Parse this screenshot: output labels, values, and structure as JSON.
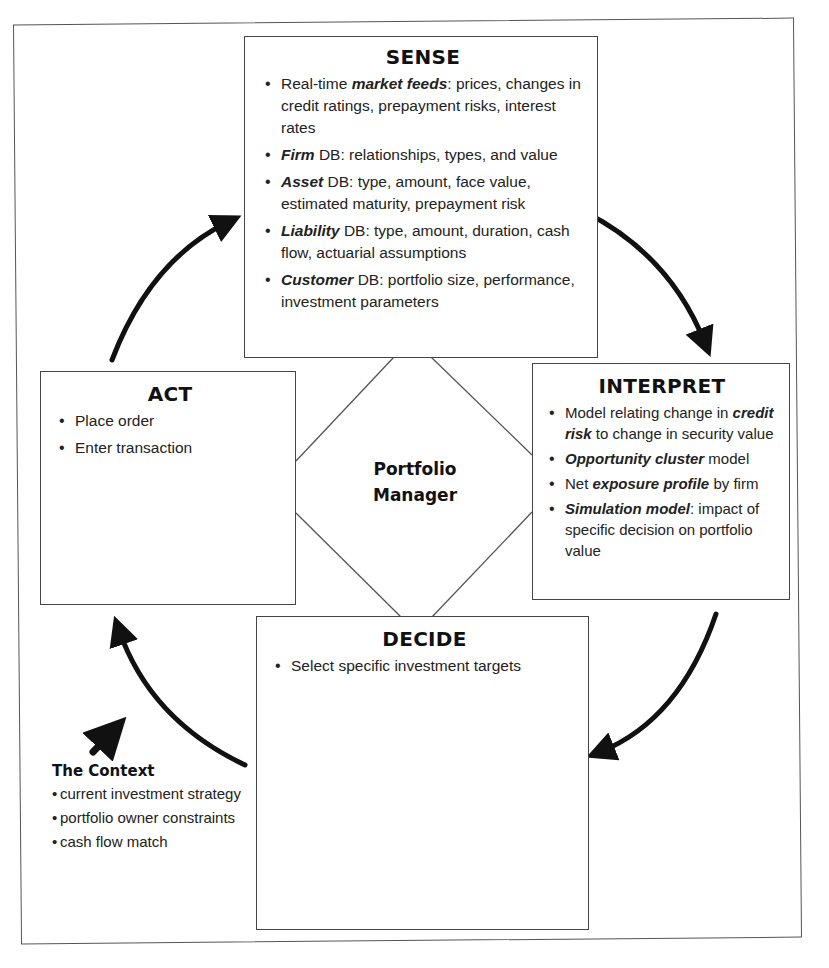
{
  "center": {
    "line1": "Portfolio",
    "line2": "Manager"
  },
  "sense": {
    "title": "SENSE",
    "items": [
      {
        "pre": "Real-time ",
        "em": "market feeds",
        "post": ": prices, changes in credit ratings, prepayment risks, interest rates"
      },
      {
        "pre": "",
        "em": "Firm",
        "post": " DB: relationships, types, and value"
      },
      {
        "pre": "",
        "em": "Asset",
        "post": " DB: type, amount, face value, estimated maturity, prepayment risk"
      },
      {
        "pre": "",
        "em": "Liability",
        "post": " DB: type, amount, duration, cash flow, actuarial assumptions"
      },
      {
        "pre": "",
        "em": "Customer",
        "post": " DB: portfolio size, performance, investment parameters"
      }
    ]
  },
  "interpret": {
    "title": "INTERPRET",
    "items": [
      {
        "pre": "Model relating change in ",
        "em": "credit risk",
        "post": " to change in security value"
      },
      {
        "pre": "",
        "em": "Opportunity cluster",
        "post": " model"
      },
      {
        "pre": "Net ",
        "em": "exposure profile",
        "post": " by firm"
      },
      {
        "pre": "",
        "em": "Simulation model",
        "post": ": impact of specific decision on portfolio value"
      }
    ]
  },
  "decide": {
    "title": "DECIDE",
    "items": [
      {
        "pre": "Select specific investment targets",
        "em": "",
        "post": ""
      }
    ]
  },
  "act": {
    "title": "ACT",
    "items": [
      {
        "pre": "Place order",
        "em": "",
        "post": ""
      },
      {
        "pre": "Enter transaction",
        "em": "",
        "post": ""
      }
    ]
  },
  "context": {
    "title": "The Context",
    "items": [
      "current investment strategy",
      "portfolio owner constraints",
      "cash flow match"
    ]
  },
  "colors": {
    "line": "#444444",
    "arrow": "#111111",
    "text": "#1a1a1a"
  }
}
